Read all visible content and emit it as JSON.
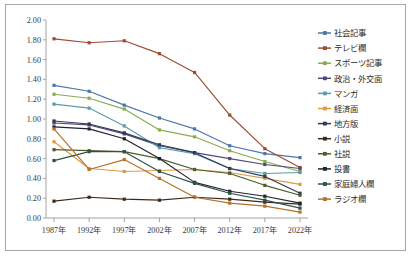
{
  "figure": {
    "border_color": "#a8a8a8",
    "background": "#ffffff",
    "axis_color": "#9a9a9a"
  },
  "chart_data": {
    "type": "line",
    "title": "",
    "xlabel": "",
    "ylabel": "",
    "categories": [
      "1987年",
      "1992年",
      "1997年",
      "2002年",
      "2007年",
      "2012年",
      "2017年",
      "2022年"
    ],
    "ylim": [
      0.0,
      2.0
    ],
    "ytick_step": 0.2,
    "yticks": [
      "0.00",
      "0.20",
      "0.40",
      "0.60",
      "0.80",
      "1.00",
      "1.20",
      "1.40",
      "1.60",
      "1.80",
      "2.00"
    ],
    "grid": false,
    "legend_position": "right",
    "marker": "square",
    "series": [
      {
        "name": "社会記事",
        "color": "#4a77a8",
        "values": [
          1.34,
          1.28,
          1.14,
          1.01,
          0.9,
          0.73,
          0.65,
          0.61
        ]
      },
      {
        "name": "テレビ欄",
        "color": "#9e4b32",
        "values": [
          1.81,
          1.77,
          1.79,
          1.66,
          1.47,
          1.04,
          0.7,
          0.51
        ]
      },
      {
        "name": "スポーツ記事",
        "color": "#8aac50",
        "values": [
          1.25,
          1.21,
          1.1,
          0.89,
          0.82,
          0.68,
          0.57,
          0.47
        ]
      },
      {
        "name": "政治・外交面",
        "color": "#504a7a",
        "values": [
          0.96,
          0.94,
          0.85,
          0.73,
          0.66,
          0.6,
          0.54,
          0.5
        ]
      },
      {
        "name": "マンガ",
        "color": "#5b9bab",
        "values": [
          1.15,
          1.11,
          0.93,
          0.71,
          0.65,
          0.5,
          0.45,
          0.46
        ]
      },
      {
        "name": "経済面",
        "color": "#e09a42",
        "values": [
          0.77,
          0.5,
          0.47,
          0.48,
          0.49,
          0.46,
          0.4,
          0.34
        ]
      },
      {
        "name": "地方版",
        "color": "#2f3a56",
        "values": [
          0.98,
          0.95,
          0.86,
          0.74,
          0.66,
          0.5,
          0.42,
          0.25
        ]
      },
      {
        "name": "小説",
        "color": "#3d2a1b",
        "values": [
          0.17,
          0.21,
          0.19,
          0.18,
          0.21,
          0.19,
          0.16,
          0.14
        ]
      },
      {
        "name": "社説",
        "color": "#4c5c2a",
        "values": [
          0.69,
          0.68,
          0.67,
          0.6,
          0.49,
          0.45,
          0.33,
          0.23
        ]
      },
      {
        "name": "投書",
        "color": "#1f2430",
        "values": [
          0.92,
          0.9,
          0.8,
          0.6,
          0.36,
          0.27,
          0.22,
          0.15
        ]
      },
      {
        "name": "家庭婦人欄",
        "color": "#2e5248",
        "values": [
          0.58,
          0.67,
          0.67,
          0.47,
          0.35,
          0.25,
          0.18,
          0.1
        ]
      },
      {
        "name": "ラジオ欄",
        "color": "#b5722a",
        "values": [
          0.9,
          0.49,
          0.59,
          0.4,
          0.21,
          0.15,
          0.12,
          0.06
        ]
      }
    ]
  }
}
